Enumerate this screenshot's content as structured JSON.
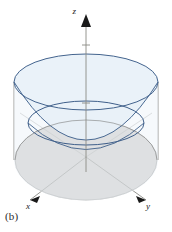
{
  "figure": {
    "panel_label": "(b)",
    "background_color": "#ffffff",
    "axes": [
      {
        "name": "z-axis",
        "label": "z",
        "label_x": 78,
        "label_y": 13,
        "direction": "up"
      },
      {
        "name": "x-axis",
        "label": "x",
        "label_x": 28,
        "label_y": 206,
        "direction": "down-left"
      },
      {
        "name": "y-axis",
        "label": "y",
        "label_x": 148,
        "label_y": 206,
        "direction": "down-right"
      }
    ],
    "colors": {
      "paraboloid_fill": "#e7f0f7",
      "paraboloid_stroke": "#4a6a93",
      "cylinder_top_fill": "#eaf2f8",
      "cylinder_stroke": "#3f5f8a",
      "disk_fill": "#c9c8c6",
      "disk_stroke": "#7d7d7d",
      "axis_color": "#8a8a85",
      "axis_arrow": "#1a1a1a",
      "label_color": "#1a1a1a"
    },
    "geometry": {
      "origin_x": 86,
      "origin_y": 157,
      "top_ellipse_cx": 86,
      "top_ellipse_cy": 82,
      "top_ellipse_rx": 72,
      "top_ellipse_ry": 28,
      "disk_ellipse_cx": 86,
      "disk_ellipse_cy": 160,
      "disk_ellipse_rx": 71,
      "disk_ellipse_ry": 40,
      "rim_ellipse_cx": 86,
      "rim_ellipse_cy": 123,
      "rim_ellipse_rx": 58,
      "rim_ellipse_ry": 22
    },
    "z_ticks": [
      {
        "y": 45
      },
      {
        "y": 103
      }
    ],
    "surfaces": [
      {
        "name": "paraboloid",
        "description": "upward opening paraboloid with vertex at origin"
      },
      {
        "name": "cylinder",
        "description": "vertical cylinder wall with elliptical top"
      },
      {
        "name": "base-disk",
        "description": "shaded gray disk region in the xy-plane"
      }
    ]
  }
}
